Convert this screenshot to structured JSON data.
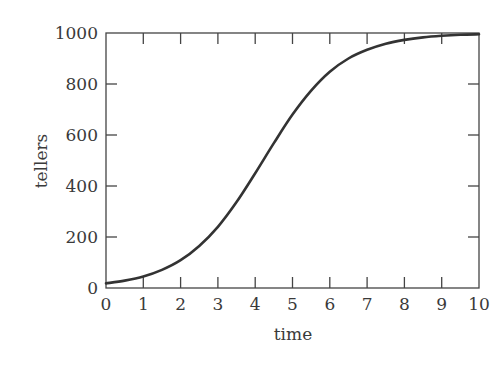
{
  "chart_data": {
    "type": "line",
    "title": "",
    "xlabel": "time",
    "ylabel": "tellers",
    "xlim": [
      0,
      10
    ],
    "ylim": [
      0,
      1000
    ],
    "grid": false,
    "legend": null,
    "x_ticks": [
      "0",
      "1",
      "2",
      "3",
      "4",
      "5",
      "6",
      "7",
      "8",
      "9",
      "10"
    ],
    "y_ticks": [
      "0",
      "200",
      "400",
      "600",
      "800",
      "1000"
    ],
    "series": [
      {
        "name": "tellers",
        "color": "#333333",
        "x": [
          0,
          0.5,
          1,
          1.5,
          2,
          2.5,
          3,
          3.5,
          4,
          4.5,
          5,
          5.5,
          6,
          6.5,
          7,
          7.5,
          8,
          8.5,
          9,
          9.5,
          10
        ],
        "y": [
          18,
          29,
          45,
          71,
          109,
          165,
          240,
          337,
          450,
          568,
          680,
          774,
          848,
          900,
          934,
          958,
          973,
          983,
          989,
          993,
          995
        ]
      }
    ]
  }
}
